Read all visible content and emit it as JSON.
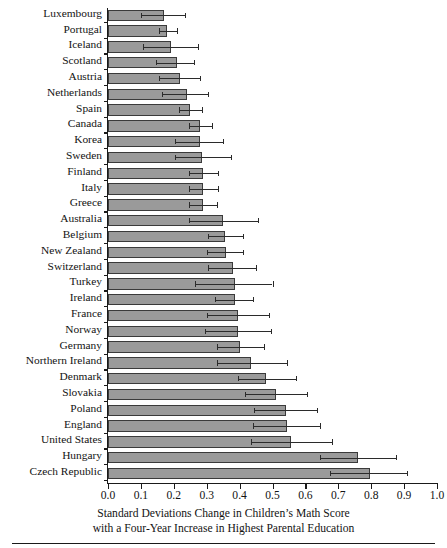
{
  "chart_data": {
    "type": "bar",
    "orientation": "horizontal",
    "title": "",
    "xlabel": "Standard Deviations Change in Children's Math Score with a Four-Year Increase in Highest Parental Education",
    "xlabel_line1": "Standard Deviations Change in Children’s Math Score",
    "xlabel_line2": "with a Four-Year Increase in Highest Parental Education",
    "ylabel": "",
    "xlim": [
      0.0,
      1.0
    ],
    "grid": false,
    "legend": false,
    "xticks": [
      0.0,
      0.1,
      0.2,
      0.3,
      0.4,
      0.5,
      0.6,
      0.7,
      0.8,
      0.9,
      1.0
    ],
    "xticklabels": [
      "0.0",
      "0.1",
      "0.2",
      "0.3",
      "0.4",
      "0.5",
      "0.6",
      "0.7",
      "0.8",
      "0.9",
      "1.0"
    ],
    "error_bars": "horizontal confidence interval with caps",
    "categories": [
      "Luxembourg",
      "Portugal",
      "Iceland",
      "Scotland",
      "Austria",
      "Netherlands",
      "Spain",
      "Canada",
      "Korea",
      "Sweden",
      "Finland",
      "Italy",
      "Greece",
      "Australia",
      "Belgium",
      "New Zealand",
      "Switzerland",
      "Turkey",
      "Ireland",
      "France",
      "Norway",
      "Germany",
      "Northern Ireland",
      "Denmark",
      "Slovakia",
      "Poland",
      "England",
      "United States",
      "Hungary",
      "Czech Republic"
    ],
    "values": [
      0.17,
      0.18,
      0.19,
      0.21,
      0.22,
      0.24,
      0.25,
      0.28,
      0.28,
      0.285,
      0.29,
      0.29,
      0.29,
      0.35,
      0.355,
      0.36,
      0.38,
      0.385,
      0.385,
      0.395,
      0.395,
      0.4,
      0.435,
      0.48,
      0.51,
      0.54,
      0.545,
      0.555,
      0.76,
      0.795
    ],
    "ci_low": [
      0.1,
      0.155,
      0.105,
      0.145,
      0.155,
      0.165,
      0.215,
      0.245,
      0.205,
      0.205,
      0.245,
      0.245,
      0.245,
      0.245,
      0.305,
      0.3,
      0.305,
      0.265,
      0.325,
      0.3,
      0.295,
      0.33,
      0.33,
      0.395,
      0.415,
      0.445,
      0.44,
      0.435,
      0.645,
      0.675
    ],
    "ci_high": [
      0.235,
      0.21,
      0.275,
      0.26,
      0.28,
      0.305,
      0.285,
      0.315,
      0.35,
      0.375,
      0.335,
      0.335,
      0.33,
      0.455,
      0.41,
      0.41,
      0.45,
      0.5,
      0.44,
      0.49,
      0.495,
      0.475,
      0.545,
      0.57,
      0.605,
      0.635,
      0.645,
      0.68,
      0.875,
      0.91
    ],
    "bar_color": "#9a9a9a",
    "bar_edge_color": "#3a3a3a",
    "error_color": "#2b2b2b"
  }
}
